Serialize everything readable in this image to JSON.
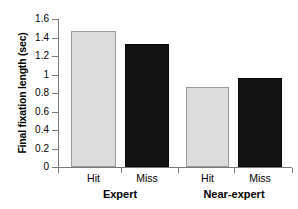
{
  "chart_data": {
    "type": "bar",
    "title": "",
    "subtitle": "",
    "xlabel": "",
    "ylabel": "Final fixation length (sec)",
    "categories": [
      "Hit",
      "Miss",
      "Hit",
      "Miss"
    ],
    "groups": [
      {
        "label": "Expert",
        "categories": [
          "Hit",
          "Miss"
        ],
        "values": [
          1.47,
          1.33
        ]
      },
      {
        "label": "Near-expert",
        "categories": [
          "Hit",
          "Miss"
        ],
        "values": [
          0.86,
          0.96
        ]
      }
    ],
    "values": [
      1.47,
      1.33,
      0.86,
      0.96
    ],
    "bar_colors": [
      "#dcdcdc",
      "#131313",
      "#dcdcdc",
      "#131313"
    ],
    "ylim": [
      0,
      1.6
    ],
    "yticks": [
      0,
      0.2,
      0.4,
      0.6,
      0.8,
      1,
      1.2,
      1.4,
      1.6
    ],
    "ytick_labels": [
      "0",
      "0.2",
      "0.4",
      "0.6",
      "0.8",
      "1",
      "1.2",
      "1.4",
      "1.6"
    ],
    "grid": false,
    "legend": false,
    "legend_position": "none",
    "accent_light": "#dcdcdc",
    "accent_dark": "#131313",
    "axis_color": "#7a7a7a"
  },
  "axis": {
    "ylabel": "Final fixation length (sec)",
    "ytick_0": "0",
    "ytick_1": "0.2",
    "ytick_2": "0.4",
    "ytick_3": "0.6",
    "ytick_4": "0.8",
    "ytick_5": "1",
    "ytick_6": "1.2",
    "ytick_7": "1.4",
    "ytick_8": "1.6"
  },
  "bars": [
    {
      "label": "Hit",
      "value": 1.47,
      "group": "Expert"
    },
    {
      "label": "Miss",
      "value": 1.33,
      "group": "Expert"
    },
    {
      "label": "Hit",
      "value": 0.86,
      "group": "Near-expert"
    },
    {
      "label": "Miss",
      "value": 0.96,
      "group": "Near-expert"
    }
  ],
  "groups": [
    {
      "label": "Expert"
    },
    {
      "label": "Near-expert"
    }
  ]
}
